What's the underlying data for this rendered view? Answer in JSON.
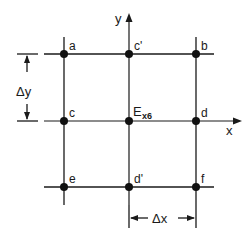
{
  "diagram": {
    "title": "",
    "axes": {
      "x_label": "x",
      "y_label": "y"
    },
    "nodes": [
      {
        "id": "a",
        "label": "a",
        "x": 64,
        "y": 54
      },
      {
        "id": "c_prime",
        "label": "c'",
        "x": 129,
        "y": 54
      },
      {
        "id": "b",
        "label": "b",
        "x": 196,
        "y": 54
      },
      {
        "id": "c",
        "label": "c",
        "x": 64,
        "y": 121
      },
      {
        "id": "E",
        "label": "E",
        "subscript": "x6",
        "x": 129,
        "y": 121
      },
      {
        "id": "d",
        "label": "d",
        "x": 196,
        "y": 121
      },
      {
        "id": "e",
        "label": "e",
        "x": 64,
        "y": 187
      },
      {
        "id": "d_prime",
        "label": "d'",
        "x": 129,
        "y": 187
      },
      {
        "id": "f",
        "label": "f",
        "x": 196,
        "y": 187
      }
    ],
    "dimensions": {
      "delta_y": "Δy",
      "delta_x": "Δx"
    }
  }
}
